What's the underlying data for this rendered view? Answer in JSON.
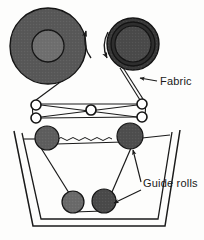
{
  "figure": {
    "background_color": "#fdfdfc",
    "line_color": "#1a1a1a"
  },
  "labels": {
    "fabric": "Fabric",
    "guide_rolls": "Guide rolls"
  },
  "rolls": {
    "supply_roll": {
      "name": "supply-roll",
      "cx": 48,
      "cy": 46,
      "r_outer": 38,
      "r_inner": 16,
      "fill_outer": "#585858",
      "fill_inner": "#6f6f6f",
      "rotation": "counter-clockwise"
    },
    "takeup_roll": {
      "name": "takeup-roll",
      "cx": 133,
      "cy": 44,
      "r_outer": 26,
      "r_mid": 22,
      "r_inner": 18,
      "fill_outer": "#3a3a3a",
      "fill_mid": "#2e2e2e",
      "fill_inner": "#4a4a4a",
      "rotation": "clockwise"
    }
  },
  "guide_rolls": [
    {
      "name": "guide-roll-upper-left",
      "cx": 47,
      "cy": 138,
      "r": 12,
      "fill": "#5e5e5e"
    },
    {
      "name": "guide-roll-upper-right",
      "cx": 130,
      "cy": 136,
      "r": 13,
      "fill": "#4e4e4e"
    },
    {
      "name": "guide-roll-lower-left",
      "cx": 73,
      "cy": 202,
      "r": 11,
      "fill": "#6a6a6a"
    },
    {
      "name": "guide-roll-lower-right",
      "cx": 104,
      "cy": 201,
      "r": 12,
      "fill": "#4a4a4a"
    }
  ],
  "tension_rollers": {
    "left_pair": [
      {
        "name": "tension-roller-left-top",
        "cx": 36,
        "cy": 105,
        "r": 5
      },
      {
        "name": "tension-roller-left-bottom",
        "cx": 36,
        "cy": 118,
        "r": 5
      }
    ],
    "right_pair": [
      {
        "name": "tension-roller-right-top",
        "cx": 142,
        "cy": 104,
        "r": 5
      },
      {
        "name": "tension-roller-right-bottom",
        "cx": 142,
        "cy": 117,
        "r": 5
      }
    ],
    "center": {
      "name": "tension-roller-center",
      "cx": 91,
      "cy": 110,
      "r": 5
    }
  },
  "tank": {
    "name": "dye-tank",
    "outer": "14,131 33,226 165,226 180,130",
    "inner": "22,133 41,219 158,219 172,132",
    "liquid_level_y": 139
  },
  "callouts": {
    "fabric_label_pos": {
      "x": 160,
      "y": 85
    },
    "guide_rolls_label_pos": {
      "x": 143,
      "y": 187
    }
  }
}
